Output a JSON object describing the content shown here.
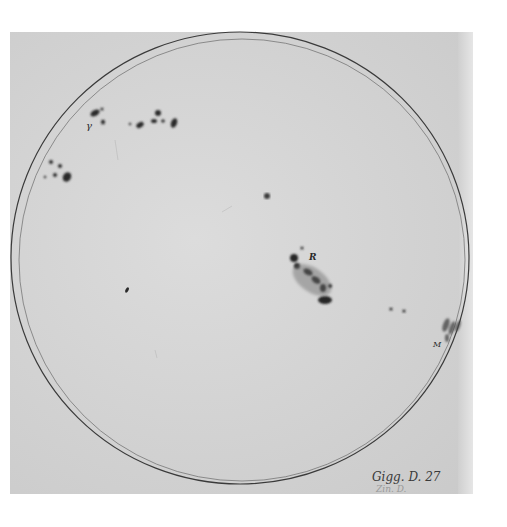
{
  "image": {
    "description": "Historical ink drawing of the solar disk with sunspot groups",
    "background_color": "#ffffff",
    "paper_color": "#d6d6d6",
    "ink_color": "#2a2a2a"
  },
  "disk": {
    "center": [
      240,
      258
    ],
    "radius_outer": 228,
    "radius_inner": 222
  },
  "labels": {
    "gamma": "γ",
    "r": "R",
    "m": "M",
    "catalog": "Gigg. D. 27",
    "catalog_faint": "Zin. D."
  },
  "sunspot_groups": [
    {
      "name": "upper-left-group",
      "label": "γ",
      "approx_center": [
        100,
        115
      ]
    },
    {
      "name": "upper-middle-group",
      "approx_center": [
        155,
        120
      ]
    },
    {
      "name": "left-group",
      "approx_center": [
        60,
        175
      ]
    },
    {
      "name": "center-single-spot",
      "approx_center": [
        267,
        195
      ]
    },
    {
      "name": "small-left-spot",
      "approx_center": [
        127,
        290
      ]
    },
    {
      "name": "central-large-group",
      "label": "R",
      "approx_center": [
        308,
        280
      ]
    },
    {
      "name": "right-pair",
      "approx_center": [
        398,
        307
      ]
    },
    {
      "name": "limb-group",
      "label": "M",
      "approx_center": [
        447,
        330
      ]
    }
  ]
}
